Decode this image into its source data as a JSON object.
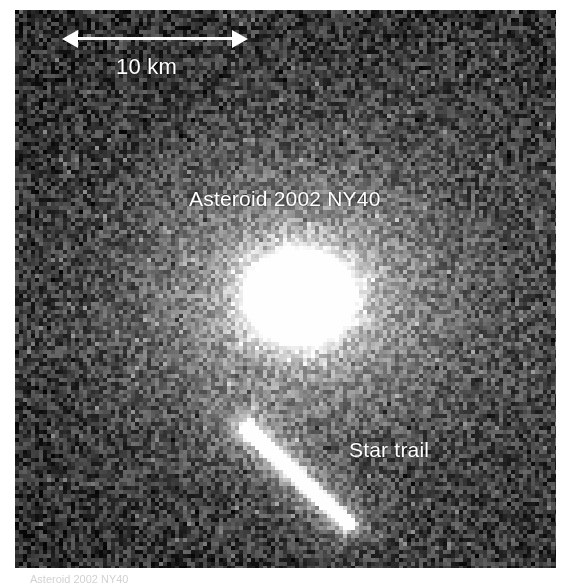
{
  "figure": {
    "kind": "astronomical-ccd-image",
    "subject": "Asteroid 2002 NY40",
    "plate": {
      "left": 15,
      "top": 10,
      "width": 541,
      "height": 558,
      "background_color": "#161616",
      "noise_min_gray": "#101010",
      "noise_max_gray": "#8a8a8a"
    },
    "annotations": {
      "asteroid_label": "Asteroid 2002 NY40",
      "star_trail_label": "Star trail",
      "scale_label": "10 km",
      "label_color": "#ffffff"
    },
    "scalebar": {
      "length_label": "10 km",
      "value": 10,
      "unit": "km",
      "pixel_length": 186,
      "style": "double-headed-arrow",
      "color": "#ffffff"
    },
    "features": [
      {
        "name": "asteroid-blob",
        "center_x": 300,
        "center_y": 297,
        "radius_x": 84,
        "radius_y": 72,
        "core_color": "#ffffff",
        "halo_color": "#9b9b9b",
        "core_spot_color": "#a8a8a8",
        "core_spot_x": 297,
        "core_spot_y": 296,
        "core_spot_r": 15
      },
      {
        "name": "star-trail",
        "x1": 248,
        "y1": 430,
        "x2": 348,
        "y2": 524,
        "color": "#ffffff",
        "halo_color": "#8f8f8f",
        "thickness": 9
      }
    ],
    "caption": "Asteroid 2002 NY40"
  }
}
